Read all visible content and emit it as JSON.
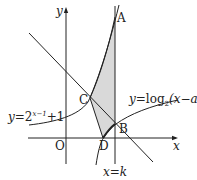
{
  "diagram": {
    "axes": {
      "x_label": "x",
      "y_label": "y",
      "origin_label": "O"
    },
    "points": {
      "A": "A",
      "B": "B",
      "C": "C",
      "D": "D"
    },
    "curves": {
      "exponential": {
        "lhs": "y",
        "eq": "=",
        "base": "2",
        "exponent": "x−1",
        "tail": "+1"
      },
      "logarithm": {
        "lhs": "y",
        "eq": "=",
        "fn": "log",
        "base": "2",
        "arg": "(x−a)"
      },
      "vertical_line": {
        "lhs": "x",
        "eq": "=",
        "rhs": "k"
      }
    },
    "colors": {
      "stroke": "#222222",
      "shade": "#d9d9d9"
    }
  }
}
